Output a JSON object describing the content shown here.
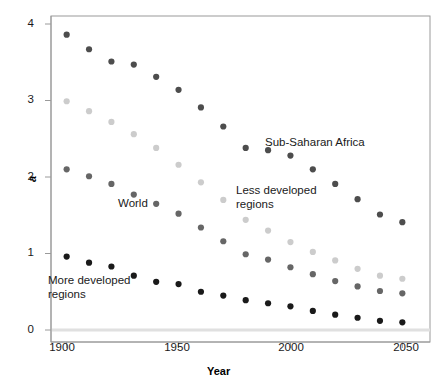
{
  "chart_data": {
    "type": "scatter",
    "title": "",
    "xlabel": "Year",
    "ylabel": "a",
    "xlim": [
      1893,
      2057
    ],
    "ylim": [
      0,
      4.1
    ],
    "xticks": [
      1900,
      1950,
      2000,
      2050
    ],
    "yticks": [
      0,
      1,
      2,
      3,
      4
    ],
    "grid": false,
    "legend": "in-plot annotations",
    "x": [
      1900,
      1910,
      1920,
      1930,
      1940,
      1950,
      1960,
      1970,
      1980,
      1990,
      2000,
      2010,
      2020,
      2030,
      2040,
      2050
    ],
    "series": [
      {
        "name": "Sub-Saharan Africa",
        "color": "#4d4d4d",
        "values": [
          3.86,
          3.67,
          3.51,
          3.47,
          3.31,
          3.14,
          2.91,
          2.66,
          2.38,
          2.35,
          2.28,
          2.1,
          1.91,
          1.71,
          1.51,
          1.41
        ]
      },
      {
        "name": "Less developed regions",
        "color": "#cccccc",
        "values": [
          2.99,
          2.86,
          2.72,
          2.56,
          2.38,
          2.16,
          1.93,
          1.7,
          1.44,
          1.3,
          1.15,
          1.02,
          0.91,
          0.8,
          0.71,
          0.67
        ]
      },
      {
        "name": "World",
        "color": "#666666",
        "values": [
          2.1,
          2.01,
          1.91,
          1.77,
          1.65,
          1.52,
          1.34,
          1.16,
          0.99,
          0.92,
          0.82,
          0.73,
          0.64,
          0.57,
          0.51,
          0.48
        ]
      },
      {
        "name": "More developed regions",
        "color": "#1a1a1a",
        "values": [
          0.96,
          0.88,
          0.83,
          0.71,
          0.63,
          0.6,
          0.5,
          0.45,
          0.39,
          0.35,
          0.31,
          0.25,
          0.2,
          0.16,
          0.12,
          0.1
        ]
      }
    ],
    "annotations": [
      {
        "name": "sub-saharan-africa",
        "text": "Sub-Saharan Africa",
        "x_px": 265,
        "y_px": 136
      },
      {
        "name": "less-developed-regions",
        "text": "Less developed\nregions",
        "x_px": 236,
        "y_px": 184
      },
      {
        "name": "world",
        "text": "World",
        "x_px": 118,
        "y_px": 197
      },
      {
        "name": "more-developed-regions",
        "text": "More developed\nregions",
        "x_px": 48,
        "y_px": 274
      }
    ],
    "baseline": {
      "value": 0,
      "color": "#e0e0e0"
    },
    "axis_color": "#9a9a9a"
  }
}
